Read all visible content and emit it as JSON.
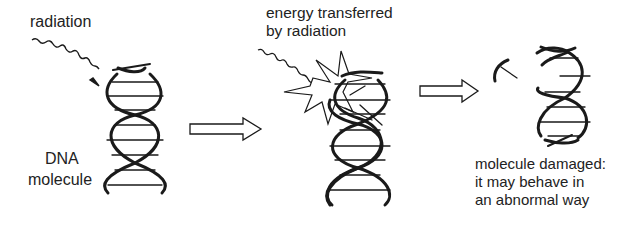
{
  "diagram": {
    "stage1": {
      "radiation_label": "radiation",
      "dna_label_line1": "DNA",
      "dna_label_line2": "molecule"
    },
    "stage2": {
      "energy_label_line1": "energy transferred",
      "energy_label_line2": "by radiation"
    },
    "stage3": {
      "result_line1": "molecule damaged:",
      "result_line2": "it may behave in",
      "result_line3": "an abnormal way"
    },
    "arrows": [
      {
        "from": "stage1",
        "to": "stage2"
      },
      {
        "from": "stage2",
        "to": "stage3"
      }
    ],
    "colors": {
      "stroke": "#1a1a1a",
      "background": "#ffffff"
    }
  }
}
